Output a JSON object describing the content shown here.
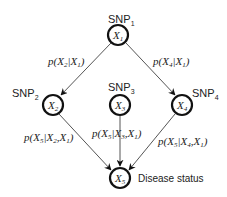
{
  "diagram": {
    "type": "bayesian-network",
    "nodes": [
      {
        "id": "X1",
        "symbol": "X",
        "sub": "1",
        "title": "SNP",
        "title_sub": "1"
      },
      {
        "id": "X2",
        "symbol": "X",
        "sub": "2",
        "title": "SNP",
        "title_sub": "2"
      },
      {
        "id": "X3",
        "symbol": "X",
        "sub": "3",
        "title": "SNP",
        "title_sub": "3"
      },
      {
        "id": "X4",
        "symbol": "X",
        "sub": "4",
        "title": "SNP",
        "title_sub": "4"
      },
      {
        "id": "X5",
        "symbol": "X",
        "sub": "5",
        "title": "Disease status"
      }
    ],
    "edges": [
      {
        "from": "X1",
        "to": "X2",
        "label": {
          "p": "p(",
          "a": "X",
          "a_sub": "2",
          "bar": "|",
          "b": "X",
          "b_sub": "1",
          "close": ")"
        }
      },
      {
        "from": "X1",
        "to": "X4",
        "label": {
          "p": "p(",
          "a": "X",
          "a_sub": "4",
          "bar": "|",
          "b": "X",
          "b_sub": "1",
          "close": ")"
        }
      },
      {
        "from": "X2",
        "to": "X5",
        "label": {
          "p": "p(",
          "a": "X",
          "a_sub": "5",
          "bar": "|",
          "b": "X",
          "b_sub": "2",
          "comma": ",",
          "c": "X",
          "c_sub": "1",
          "close": ")"
        }
      },
      {
        "from": "X3",
        "to": "X5",
        "label": {
          "p": "p(",
          "a": "X",
          "a_sub": "5",
          "bar": "|",
          "b": "X",
          "b_sub": "3",
          "comma": ",",
          "c": "X",
          "c_sub": "1",
          "close": ")"
        }
      },
      {
        "from": "X4",
        "to": "X5",
        "label": {
          "p": "p(",
          "a": "X",
          "a_sub": "5",
          "bar": "|",
          "b": "X",
          "b_sub": "4",
          "comma": ",",
          "c": "X",
          "c_sub": "1",
          "close": ")"
        }
      }
    ]
  }
}
